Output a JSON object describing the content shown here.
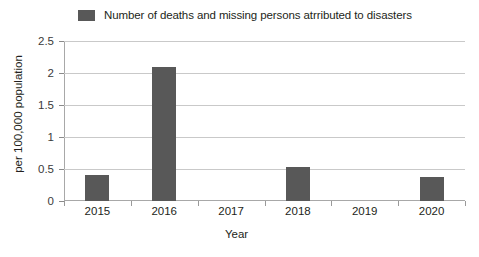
{
  "chart_data": {
    "type": "bar",
    "title": "",
    "categories": [
      "2015",
      "2016",
      "2017",
      "2018",
      "2019",
      "2020"
    ],
    "values": [
      0.4,
      2.1,
      0,
      0.53,
      0,
      0.38
    ],
    "series": [
      {
        "name": "Number of deaths and missing persons atrributed to disasters",
        "values": [
          0.4,
          2.1,
          0,
          0.53,
          0,
          0.38
        ]
      }
    ],
    "xlabel": "Year",
    "ylabel": "per 100,000 population",
    "ylim": [
      0,
      2.5
    ],
    "yticks": [
      "0",
      "0.5",
      "1",
      "1.5",
      "2",
      "2.5"
    ],
    "ytick_values": [
      0,
      0.5,
      1,
      1.5,
      2,
      2.5
    ],
    "grid": true,
    "legend_position": "top",
    "bar_color": "#585858",
    "gridline_color": "#c9c9c9"
  },
  "legend": {
    "label": "Number of deaths and missing persons atrributed to disasters",
    "swatch_color": "#585858"
  },
  "axes": {
    "x_title": "Year",
    "y_title": "per 100,000 population"
  }
}
